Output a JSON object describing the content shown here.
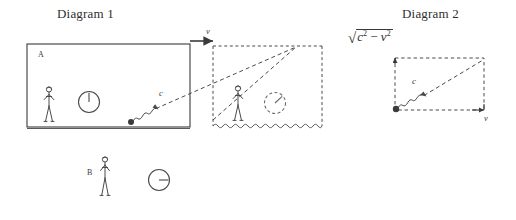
{
  "figure": {
    "titles": {
      "diagram1": "Diagram 1",
      "diagram2": "Diagram 2"
    },
    "labels": {
      "observer_a": "A",
      "observer_b": "B",
      "velocity_top": "v",
      "light_speed_box": "c",
      "light_speed_d2": "c",
      "velocity_d2": "v"
    },
    "formula": {
      "radical_sign": "√",
      "c_base": "c",
      "c_exp": "2",
      "minus": "−",
      "v_base": "v",
      "v_exp": "2",
      "plain_text": "√(c² − v²)"
    },
    "colors": {
      "ink": "#3a3a3a",
      "title_ink": "#2f2f2f",
      "background": "#ffffff"
    },
    "elements": {
      "solid_box_label": "train-frame-box",
      "dashed_box_label": "moving-frame-box",
      "clock_a_time": "12 o'clock",
      "clock_b_time": "3 o'clock",
      "clock_dashed_time": "1:30 o'clock"
    }
  }
}
